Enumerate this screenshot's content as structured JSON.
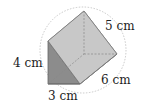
{
  "figure": {
    "type": "triangular-prism",
    "labels": {
      "height": "4 cm",
      "base": "3 cm",
      "length": "6 cm",
      "hypotenuse": "5 cm"
    },
    "colors": {
      "front_face": "#8c8c8c",
      "top_face": "#c4c4c4",
      "side_face": "#d2d2d2",
      "edge": "#6e6e6e",
      "sphere": "#bbbbbb"
    }
  }
}
